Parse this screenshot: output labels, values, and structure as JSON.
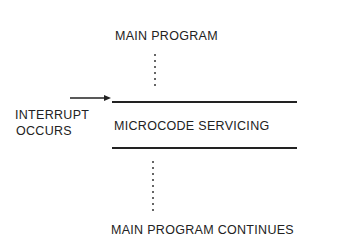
{
  "diagram": {
    "main_program": "MAIN PROGRAM",
    "interrupt_line1": "INTERRUPT",
    "interrupt_line2": "OCCURS",
    "microcode_servicing": "MICROCODE SERVICING",
    "main_program_continues": "MAIN PROGRAM CONTINUES",
    "arrow_icon": "right-arrow",
    "line_color": "#222222"
  }
}
